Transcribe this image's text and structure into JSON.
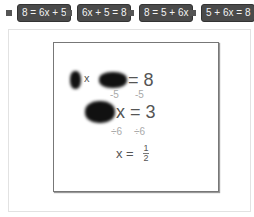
{
  "options": [
    {
      "label": "8 = 6x + 5"
    },
    {
      "label": "6x + 5 = 8"
    },
    {
      "label": "8 = 5 + 6x"
    },
    {
      "label": "5 + 6x = 8"
    }
  ],
  "image": {
    "line1": {
      "x": "x",
      "eq": "= 8"
    },
    "step1": {
      "left": "-5",
      "right": "-5"
    },
    "line2": {
      "eq": "x = 3"
    },
    "step2": {
      "left": "÷6",
      "right": "÷6"
    },
    "line3": {
      "lhs": "x =",
      "num": "1",
      "den": "2"
    }
  },
  "colors": {
    "chip_bg": "#4a4a4a",
    "chip_text": "#f2f2f2",
    "radio": "#555555"
  }
}
